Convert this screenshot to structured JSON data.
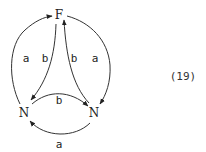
{
  "diagram": {
    "nodes": [
      {
        "id": "F",
        "label": "F"
      },
      {
        "id": "N1",
        "label": "N"
      },
      {
        "id": "N2",
        "label": "N"
      }
    ],
    "edges": [
      {
        "from": "N1",
        "to": "F",
        "label": "a"
      },
      {
        "from": "F",
        "to": "N1",
        "label": "b"
      },
      {
        "from": "N2",
        "to": "F",
        "label": "b"
      },
      {
        "from": "F",
        "to": "N2",
        "label": "a"
      },
      {
        "from": "N1",
        "to": "N2",
        "label": "b"
      },
      {
        "from": "N2",
        "to": "N1",
        "label": "a"
      }
    ],
    "equation_number": "(19)"
  }
}
